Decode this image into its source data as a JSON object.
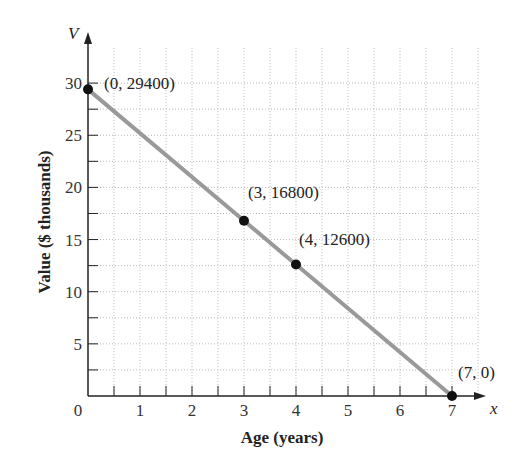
{
  "chart_data": {
    "type": "line",
    "title": "",
    "xlabel": "Age (years)",
    "ylabel": "Value ($ thousands)",
    "x_axis_var": "x",
    "y_axis_var": "V",
    "xlim": [
      0,
      7.5
    ],
    "ylim": [
      0,
      32
    ],
    "x_ticks": [
      "0",
      "1",
      "2",
      "3",
      "4",
      "5",
      "6",
      "7"
    ],
    "y_ticks": [
      "5",
      "10",
      "15",
      "20",
      "25",
      "30"
    ],
    "grid": true,
    "series": [
      {
        "name": "Value",
        "x": [
          0,
          3,
          4,
          7
        ],
        "y": [
          29.4,
          16.8,
          12.6,
          0
        ],
        "color": "#999999"
      }
    ],
    "annotations": [
      "(0, 29400)",
      "(3, 16800)",
      "(4, 12600)",
      "(7, 0)"
    ]
  }
}
